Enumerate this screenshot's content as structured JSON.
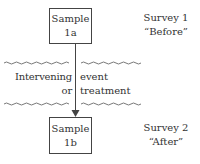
{
  "diagram": {
    "top_box": {
      "line1": "Sample",
      "line2": "1a"
    },
    "bottom_box": {
      "line1": "Sample",
      "line2": "1b"
    },
    "survey1": {
      "line1": "Survey 1",
      "line2": "“Before”"
    },
    "survey2": {
      "line1": "Survey 2",
      "line2": "“After”"
    },
    "intervening": {
      "left_line1": "Intervening",
      "left_line2": "or",
      "right_line1": "event",
      "right_line2": "treatment"
    },
    "colors": {
      "stroke": "#444444",
      "text": "#333333"
    }
  }
}
